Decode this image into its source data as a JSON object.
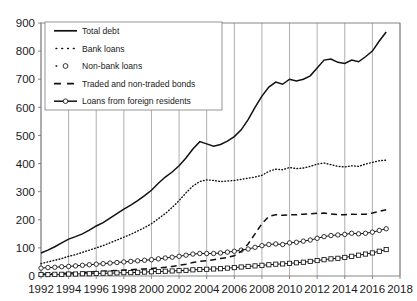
{
  "chart_data": {
    "type": "line",
    "title": "",
    "subtitle": "",
    "xlabel": "",
    "ylabel": "",
    "xlim": [
      1992,
      2018
    ],
    "ylim": [
      0,
      900
    ],
    "ytick_step": 100,
    "xtick_step": 2,
    "grid": "vertical",
    "legend_position": "top-left",
    "yticks": [
      "0",
      "100",
      "200",
      "300",
      "400",
      "500",
      "600",
      "700",
      "800",
      "900"
    ],
    "xticks": [
      "1992",
      "1994",
      "1996",
      "1998",
      "2000",
      "2002",
      "2004",
      "2006",
      "2008",
      "2010",
      "2012",
      "2014",
      "2016",
      "2018"
    ],
    "x": [
      1992.0,
      1992.5,
      1993.0,
      1993.5,
      1994.0,
      1994.5,
      1995.0,
      1995.5,
      1996.0,
      1996.5,
      1997.0,
      1997.5,
      1998.0,
      1998.5,
      1999.0,
      1999.5,
      2000.0,
      2000.5,
      2001.0,
      2001.5,
      2002.0,
      2002.5,
      2003.0,
      2003.5,
      2004.0,
      2004.5,
      2005.0,
      2005.5,
      2006.0,
      2006.5,
      2007.0,
      2007.5,
      2008.0,
      2008.5,
      2009.0,
      2009.5,
      2010.0,
      2010.5,
      2011.0,
      2011.5,
      2012.0,
      2012.5,
      2013.0,
      2013.5,
      2014.0,
      2014.5,
      2015.0,
      2015.5,
      2016.0,
      2016.5,
      2017.0
    ],
    "series": [
      {
        "name": "Total debt",
        "style": "solid",
        "marker": "none",
        "values": [
          82,
          92,
          104,
          118,
          131,
          140,
          150,
          163,
          178,
          190,
          206,
          222,
          238,
          252,
          268,
          286,
          305,
          330,
          352,
          370,
          392,
          420,
          452,
          478,
          470,
          462,
          468,
          480,
          496,
          520,
          556,
          600,
          640,
          672,
          690,
          682,
          700,
          694,
          700,
          712,
          740,
          768,
          772,
          760,
          756,
          768,
          762,
          780,
          800,
          836,
          868
        ]
      },
      {
        "name": "Bank loans",
        "style": "dotted",
        "marker": "none",
        "values": [
          44,
          50,
          56,
          62,
          70,
          76,
          84,
          92,
          100,
          108,
          118,
          128,
          138,
          148,
          160,
          172,
          186,
          204,
          222,
          244,
          268,
          296,
          320,
          336,
          342,
          340,
          336,
          338,
          340,
          344,
          348,
          352,
          358,
          372,
          380,
          378,
          386,
          382,
          384,
          390,
          398,
          402,
          396,
          390,
          388,
          392,
          390,
          398,
          404,
          410,
          412
        ]
      },
      {
        "name": "Non-bank loans",
        "style": "dotted",
        "marker": "circle",
        "values": [
          28,
          30,
          31,
          33,
          34,
          36,
          38,
          40,
          42,
          44,
          46,
          48,
          50,
          52,
          54,
          56,
          58,
          61,
          64,
          67,
          70,
          74,
          78,
          80,
          80,
          80,
          82,
          85,
          88,
          92,
          96,
          102,
          108,
          112,
          114,
          112,
          118,
          120,
          124,
          128,
          134,
          140,
          144,
          146,
          148,
          152,
          150,
          152,
          156,
          162,
          168
        ]
      },
      {
        "name": "Traded and non-traded bonds",
        "style": "dashed",
        "marker": "none",
        "values": [
          6,
          7,
          8,
          9,
          10,
          12,
          13,
          14,
          16,
          17,
          18,
          20,
          21,
          22,
          24,
          25,
          27,
          29,
          31,
          34,
          38,
          42,
          48,
          52,
          54,
          58,
          62,
          66,
          72,
          88,
          114,
          150,
          186,
          212,
          218,
          216,
          218,
          218,
          220,
          221,
          223,
          224,
          221,
          218,
          218,
          220,
          219,
          220,
          224,
          230,
          236
        ]
      },
      {
        "name": "Loans from foreign residents",
        "style": "solid",
        "marker": "square",
        "values": [
          5,
          5,
          6,
          6,
          7,
          7,
          8,
          8,
          9,
          10,
          10,
          11,
          12,
          12,
          13,
          14,
          15,
          16,
          17,
          18,
          19,
          20,
          22,
          23,
          24,
          25,
          26,
          28,
          30,
          32,
          34,
          36,
          38,
          40,
          42,
          43,
          45,
          47,
          49,
          52,
          55,
          58,
          61,
          63,
          66,
          70,
          74,
          78,
          82,
          88,
          94
        ]
      }
    ]
  },
  "legend": {
    "items": [
      {
        "label": "Total debt",
        "key": "total"
      },
      {
        "label": "Bank loans",
        "key": "bank"
      },
      {
        "label": "Non-bank loans",
        "key": "nonbank"
      },
      {
        "label": "Traded and non-traded bonds",
        "key": "bonds"
      },
      {
        "label": "Loans from foreign residents",
        "key": "foreign"
      }
    ]
  },
  "colors": {
    "series": "#111111",
    "grid": "#9a9a9a",
    "frame": "#7a7a7a",
    "background": "#ffffff"
  }
}
